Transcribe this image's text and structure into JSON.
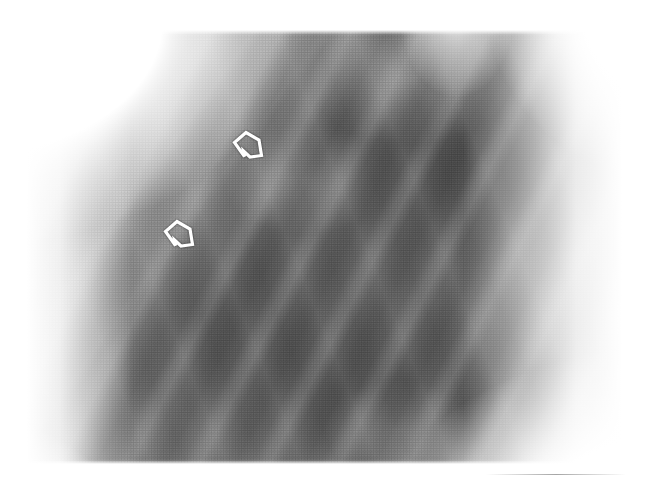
{
  "image": {
    "kind": "radiograph",
    "modality": "plain-film-radiograph",
    "view_label": "",
    "background_color": "#ffffff",
    "film_tone_dark": "#6a6a6a",
    "film_tone_mid": "#8a8a8a",
    "film_tone_light": "#c8c8c8",
    "marker_color": "#ffffff",
    "texture": "halftone-print-screen",
    "width": 662,
    "height": 500
  },
  "annotations": {
    "count": 2,
    "style": "hollow-outline-arrowhead",
    "markers": [
      {
        "id": "marker-upper",
        "name": "arrow-marker-upper",
        "shape": "open-arrowhead",
        "direction": "left",
        "x": 231,
        "y": 128,
        "width": 34,
        "height": 34
      },
      {
        "id": "marker-lower",
        "name": "arrow-marker-lower",
        "shape": "open-arrowhead",
        "direction": "left",
        "x": 162,
        "y": 217,
        "width": 34,
        "height": 34
      }
    ]
  },
  "overlay_text": {
    "caption": "",
    "labels": []
  }
}
